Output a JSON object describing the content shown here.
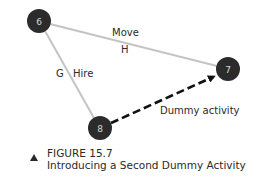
{
  "diagram": {
    "nodes": [
      {
        "id": "6",
        "label": "6",
        "cx": 39,
        "cy": 21,
        "r": 12
      },
      {
        "id": "7",
        "label": "7",
        "cx": 228,
        "cy": 69,
        "r": 12
      },
      {
        "id": "8",
        "label": "8",
        "cx": 100,
        "cy": 128,
        "r": 12
      }
    ],
    "edges": [
      {
        "from": "6",
        "to": "7",
        "style": "solid",
        "activity": "H",
        "description": "Move"
      },
      {
        "from": "6",
        "to": "8",
        "style": "solid",
        "activity": "G",
        "description": "Hire"
      },
      {
        "from": "8",
        "to": "7",
        "style": "dashed-arrow",
        "description": "Dummy activity"
      }
    ],
    "labels": {
      "move": "Move",
      "h": "H",
      "g": "G",
      "hire": "Hire",
      "dummy": "Dummy activity"
    },
    "colors": {
      "node_fill": "#2b2b2b",
      "node_text": "#d8d8d8",
      "solid_edge": "#c4c4c4",
      "dashed_edge": "#111111"
    }
  },
  "caption": {
    "figure": "FIGURE 15.7",
    "title": "Introducing a Second Dummy Activity"
  }
}
